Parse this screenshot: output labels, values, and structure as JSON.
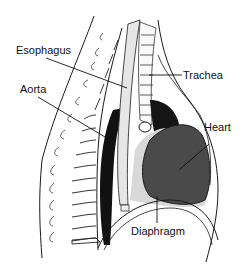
{
  "diagram": {
    "labels": {
      "esophagus": "Esophagus",
      "aorta": "Aorta",
      "trachea": "Trachea",
      "heart": "Heart",
      "diaphragm": "Diaphragm"
    },
    "colors": {
      "line": "#1a1a1a",
      "heart_fill": "#4a4a4a",
      "aorta_fill": "#111111",
      "lung_dark": "#151515",
      "stipple": "#cfcfcf",
      "background": "#ffffff"
    }
  }
}
